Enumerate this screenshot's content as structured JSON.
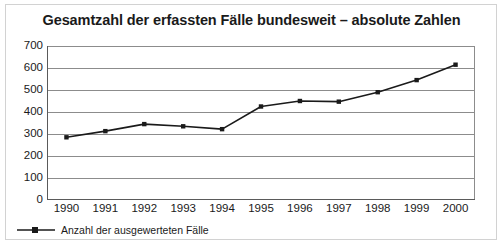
{
  "chart_data": {
    "type": "line",
    "title": "Gesamtzahl der erfassten Fälle bundesweit – absolute Zahlen",
    "xlabel": "",
    "ylabel": "",
    "categories": [
      "1990",
      "1991",
      "1992",
      "1993",
      "1994",
      "1995",
      "1996",
      "1997",
      "1998",
      "1999",
      "2000"
    ],
    "series": [
      {
        "name": "Anzahl der ausgewerteten Fälle",
        "values": [
          285,
          313,
          345,
          335,
          322,
          425,
          450,
          447,
          490,
          545,
          615
        ]
      }
    ],
    "yticks": [
      0,
      100,
      200,
      300,
      400,
      500,
      600,
      700
    ],
    "ytick_labels": [
      "0",
      "100",
      "200",
      "300",
      "400",
      "500",
      "600",
      "700"
    ],
    "ylim": [
      0,
      700
    ],
    "grid": "horizontal",
    "legend_position": "bottom-left",
    "line_color": "#1a1a1a",
    "marker": "square",
    "marker_color": "#1a1a1a",
    "gridline_color": "#8c8c8c",
    "axis_color": "#5a5a5a",
    "background_color": "#ffffff",
    "border_color": "#d2d2d2"
  },
  "legend": {
    "entries": [
      {
        "label": "Anzahl der ausgewerteten Fälle",
        "marker": "line-square-marker"
      }
    ]
  }
}
